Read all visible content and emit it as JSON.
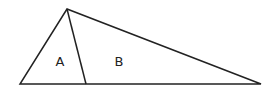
{
  "diagram": {
    "type": "geometry",
    "points": {
      "apex": [
        67,
        9
      ],
      "base_left": [
        20,
        84
      ],
      "base_right": [
        261,
        84
      ],
      "divider_foot": [
        86,
        84
      ]
    },
    "regions": [
      {
        "id": "A",
        "label": "A",
        "pos": [
          60,
          66
        ]
      },
      {
        "id": "B",
        "label": "B",
        "pos": [
          119,
          66
        ]
      }
    ],
    "stroke_color": "#222222",
    "background": "#ffffff"
  }
}
